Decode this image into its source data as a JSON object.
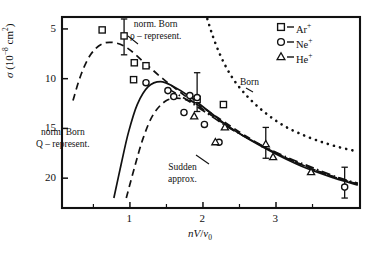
{
  "chart_data": {
    "type": "scatter",
    "title": "",
    "xlabel": "nV/v_0",
    "ylabel": "sigma (10^-8 cm^2)",
    "xlim": [
      0.07,
      4.15
    ],
    "ylim": [
      2.0,
      21.2
    ],
    "xticks": [
      1,
      2,
      3
    ],
    "xminorticks": [
      0.5,
      1.5,
      2.5,
      3.5
    ],
    "yticks": [
      5,
      10,
      15,
      20
    ],
    "grid": false,
    "legend_position": "top-right",
    "series": [
      {
        "name": "Ar+",
        "marker": "square",
        "points": [
          {
            "x": 0.62,
            "y": 19.9
          },
          {
            "x": 0.92,
            "y": 19.3
          },
          {
            "x": 1.06,
            "y": 16.6
          },
          {
            "x": 1.22,
            "y": 16.3
          },
          {
            "x": 1.05,
            "y": 14.9
          },
          {
            "x": 1.92,
            "y": 12.9
          },
          {
            "x": 2.28,
            "y": 12.4
          }
        ]
      },
      {
        "name": "Ne+",
        "marker": "circle",
        "points": [
          {
            "x": 1.22,
            "y": 14.6
          },
          {
            "x": 1.52,
            "y": 13.8
          },
          {
            "x": 1.6,
            "y": 13.2
          },
          {
            "x": 1.82,
            "y": 13.3
          },
          {
            "x": 1.92,
            "y": 13.1
          },
          {
            "x": 1.74,
            "y": 11.6
          },
          {
            "x": 2.02,
            "y": 10.4
          },
          {
            "x": 2.22,
            "y": 8.6
          },
          {
            "x": 3.94,
            "y": 4.1
          }
        ]
      },
      {
        "name": "He+",
        "marker": "triangle",
        "points": [
          {
            "x": 1.88,
            "y": 11.2
          },
          {
            "x": 2.17,
            "y": 8.6
          },
          {
            "x": 2.3,
            "y": 10.1
          },
          {
            "x": 2.86,
            "y": 8.4
          },
          {
            "x": 2.96,
            "y": 7.1
          },
          {
            "x": 3.48,
            "y": 5.6
          }
        ]
      }
    ],
    "errorbars": [
      {
        "x": 0.92,
        "y": 19.3,
        "lo": 17.4,
        "hi": 21.0
      },
      {
        "x": 1.92,
        "y": 13.1,
        "lo": 11.7,
        "hi": 15.6
      },
      {
        "x": 2.86,
        "y": 8.4,
        "lo": 7.0,
        "hi": 10.1
      },
      {
        "x": 3.94,
        "y": 4.1,
        "lo": 3.0,
        "hi": 6.1
      }
    ],
    "curves": [
      {
        "name": "norm. Born rho-represent.",
        "style": "dashed",
        "points": [
          [
            0.22,
            12.8
          ],
          [
            0.33,
            15.4
          ],
          [
            0.46,
            17.4
          ],
          [
            0.62,
            18.5
          ],
          [
            0.8,
            18.6
          ],
          [
            0.98,
            18.0
          ],
          [
            1.2,
            16.6
          ],
          [
            1.45,
            15.0
          ],
          [
            1.75,
            13.3
          ],
          [
            2.1,
            11.4
          ],
          [
            2.5,
            9.5
          ],
          [
            2.95,
            7.7
          ],
          [
            3.4,
            6.2
          ],
          [
            3.8,
            5.1
          ],
          [
            4.12,
            4.4
          ]
        ]
      },
      {
        "name": "norm. Born Q-represent.",
        "style": "solid",
        "points": [
          [
            0.78,
            3.0
          ],
          [
            0.88,
            6.4
          ],
          [
            0.98,
            9.6
          ],
          [
            1.1,
            12.4
          ],
          [
            1.25,
            14.2
          ],
          [
            1.42,
            14.7
          ],
          [
            1.6,
            14.2
          ],
          [
            1.82,
            13.2
          ],
          [
            2.1,
            11.6
          ],
          [
            2.45,
            9.7
          ],
          [
            2.9,
            7.8
          ],
          [
            3.35,
            6.2
          ],
          [
            3.8,
            5.0
          ],
          [
            4.12,
            4.3
          ]
        ]
      },
      {
        "name": "lower arc",
        "style": "dashed",
        "points": [
          [
            0.95,
            3.0
          ],
          [
            1.06,
            6.0
          ],
          [
            1.18,
            9.0
          ],
          [
            1.32,
            11.4
          ],
          [
            1.5,
            12.8
          ],
          [
            1.7,
            13.0
          ],
          [
            1.92,
            12.4
          ],
          [
            2.2,
            11.1
          ],
          [
            2.55,
            9.4
          ],
          [
            2.95,
            7.7
          ],
          [
            3.4,
            6.2
          ],
          [
            3.85,
            5.0
          ],
          [
            4.12,
            4.4
          ]
        ]
      },
      {
        "name": "Born",
        "style": "dotted",
        "points": [
          [
            2.06,
            21.0
          ],
          [
            2.12,
            19.6
          ],
          [
            2.2,
            18.0
          ],
          [
            2.3,
            16.4
          ],
          [
            2.42,
            14.9
          ],
          [
            2.56,
            13.6
          ],
          [
            2.72,
            12.4
          ],
          [
            2.9,
            11.3
          ],
          [
            3.1,
            10.3
          ],
          [
            3.32,
            9.5
          ],
          [
            3.56,
            8.8
          ],
          [
            3.82,
            8.2
          ],
          [
            4.1,
            7.7
          ]
        ]
      },
      {
        "name": "Sudden approx.",
        "style": "dashdot",
        "points": [
          [
            1.52,
            14.0
          ],
          [
            1.75,
            13.0
          ],
          [
            2.02,
            11.7
          ],
          [
            2.35,
            10.1
          ],
          [
            2.72,
            8.6
          ],
          [
            3.12,
            7.2
          ],
          [
            3.52,
            6.0
          ],
          [
            3.88,
            5.0
          ],
          [
            4.12,
            4.5
          ]
        ]
      }
    ],
    "annotations": [
      {
        "id": "ann-norm-born-rho",
        "line1": "norm. Born",
        "line2": "ρ – represent.",
        "x": 1.1,
        "y": 19.6
      },
      {
        "id": "ann-norm-born-q",
        "line1": "norm. Born",
        "line2": "Q – represent.",
        "x": 0.55,
        "y": 9.0
      },
      {
        "id": "ann-born",
        "line1": "Born",
        "line2": "",
        "x": 2.78,
        "y": 15.0
      },
      {
        "id": "ann-sudden",
        "line1": "Sudden",
        "line2": "approx.",
        "x": 2.22,
        "y": 6.3
      }
    ],
    "legend_entries": [
      {
        "marker": "square",
        "label": "Ar",
        "charge": "+"
      },
      {
        "marker": "circle",
        "label": "Ne",
        "charge": "+"
      },
      {
        "marker": "triangle",
        "label": "He",
        "charge": "+"
      }
    ],
    "axis_label_y": {
      "symbol": "σ",
      "paren_open": "(",
      "base": "10",
      "exp": "−8",
      "unit": "cm",
      "unit_exp": "2",
      "paren_close": ")"
    },
    "axis_label_x": {
      "n": "n",
      "V": "V",
      "slash": "/",
      "v": "v",
      "sub": "0"
    },
    "ticklabels_x": [
      "1",
      "2",
      "3"
    ],
    "ticklabels_y": [
      "20",
      "15",
      "10",
      "5"
    ],
    "colors": {
      "ink": "#111111",
      "background": "#ffffff"
    }
  }
}
